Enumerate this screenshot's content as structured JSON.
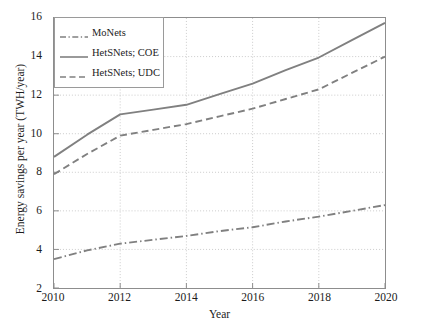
{
  "chart_data": {
    "type": "line",
    "title": "",
    "xlabel": "Year",
    "ylabel": "Energy savings per year (TWH/year)",
    "x": [
      2010,
      2011,
      2012,
      2013,
      2014,
      2015,
      2016,
      2017,
      2018,
      2019,
      2020
    ],
    "xlim": [
      2010,
      2020
    ],
    "ylim": [
      2,
      16
    ],
    "xticks": [
      2010,
      2012,
      2014,
      2016,
      2018,
      2020
    ],
    "yticks": [
      2,
      4,
      6,
      8,
      10,
      12,
      14,
      16
    ],
    "xtick_labels": [
      "2010",
      "2012",
      "2014",
      "2016",
      "2018",
      "2020"
    ],
    "ytick_labels": [
      "2",
      "4",
      "6",
      "8",
      "10",
      "12",
      "14",
      "16"
    ],
    "grid": true,
    "grid_style": "dotted",
    "legend_position": "upper-left",
    "series": [
      {
        "name": "MoNets",
        "style": "dashdot",
        "color": "#808080",
        "values": [
          3.5,
          3.95,
          4.3,
          4.5,
          4.7,
          4.95,
          5.15,
          5.45,
          5.7,
          6.0,
          6.3
        ]
      },
      {
        "name": "HetSNets; COE",
        "style": "solid",
        "color": "#808080",
        "values": [
          8.8,
          9.95,
          11.0,
          11.25,
          11.5,
          12.05,
          12.6,
          13.3,
          13.95,
          14.85,
          15.75
        ]
      },
      {
        "name": "HetSNets; UDC",
        "style": "dashed",
        "color": "#808080",
        "values": [
          7.9,
          8.95,
          9.9,
          10.2,
          10.5,
          10.9,
          11.3,
          11.8,
          12.3,
          13.15,
          14.0
        ]
      }
    ]
  },
  "legend": {
    "entries": [
      {
        "label": "MoNets"
      },
      {
        "label": "HetSNets; COE"
      },
      {
        "label": "HetSNets; UDC"
      }
    ]
  },
  "axes": {
    "x_title": "Year",
    "y_title": "Energy savings per year (TWH/year)"
  },
  "colors": {
    "line": "#808080",
    "frame": "#8d8d8d",
    "grid": "#bfbfbf",
    "text": "#1b1b1b",
    "background": "#ffffff"
  }
}
